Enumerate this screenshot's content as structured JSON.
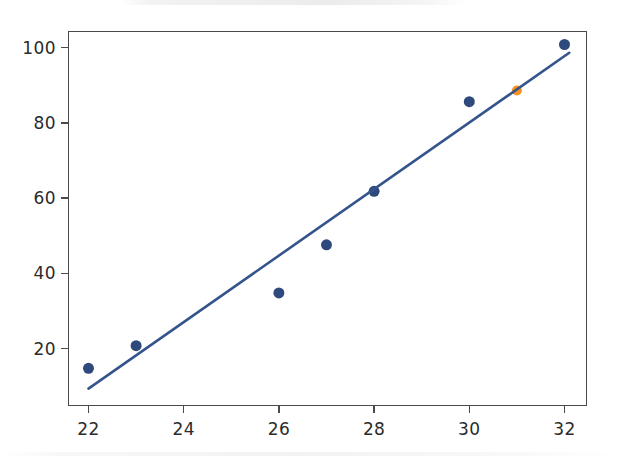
{
  "figure": {
    "title": "",
    "background_color": "#ffffff",
    "frame_color": "#4a4a4a",
    "width": 617,
    "height": 456
  },
  "chart_data": {
    "type": "scatter",
    "title": "",
    "xlabel": "",
    "ylabel": "",
    "xlim": [
      21.6,
      32.5
    ],
    "ylim": [
      6.5,
      105
    ],
    "grid": false,
    "legend": null,
    "xticks": [
      22,
      24,
      26,
      28,
      30,
      32
    ],
    "xtick_labels": [
      "22",
      "24",
      "26",
      "28",
      "30",
      "32"
    ],
    "yticks": [
      20,
      40,
      60,
      80,
      100
    ],
    "ytick_labels": [
      "20",
      "40",
      "60",
      "80",
      "100"
    ],
    "series": [
      {
        "name": "observed",
        "type": "scatter",
        "color": "#2e4a7d",
        "marker": "circle",
        "marker_size": 11,
        "x": [
          22,
          23,
          26,
          27,
          28,
          30,
          32
        ],
        "y": [
          14.8,
          20.8,
          34.8,
          47.6,
          61.8,
          85.6,
          100.8
        ]
      },
      {
        "name": "highlighted",
        "type": "scatter",
        "color": "#f7941e",
        "marker": "circle",
        "marker_size": 10,
        "x": [
          31
        ],
        "y": [
          88.6
        ]
      },
      {
        "name": "regression-line",
        "type": "line",
        "color": "#34558b",
        "line_width": 2.6,
        "x": [
          22.0,
          32.1
        ],
        "y": [
          9.4,
          98.6
        ]
      }
    ]
  }
}
